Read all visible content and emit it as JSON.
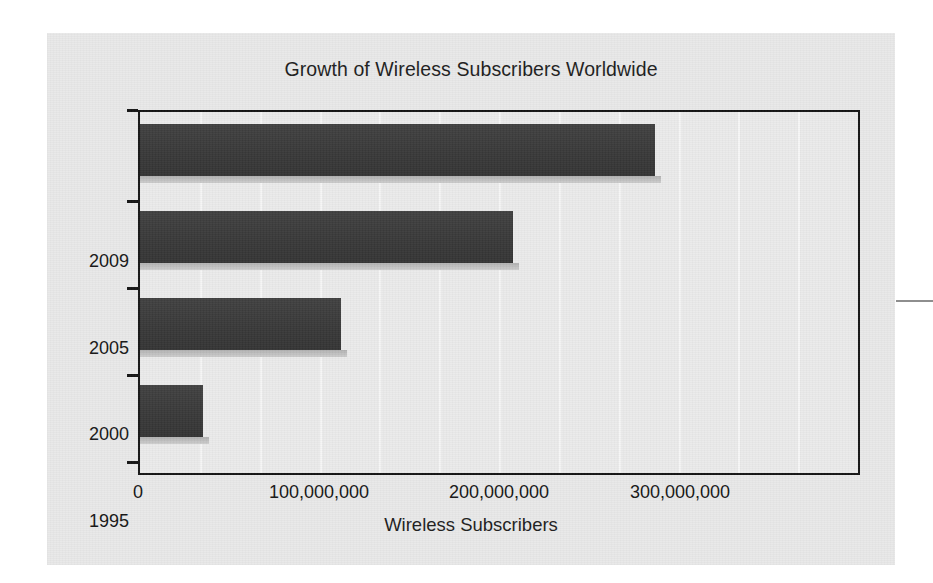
{
  "chart_data": {
    "type": "bar",
    "orientation": "horizontal",
    "title": "Growth of Wireless Subscribers Worldwide",
    "xlabel": "Wireless Subscribers",
    "ylabel": "",
    "categories": [
      "2009",
      "2005",
      "2000",
      "1995"
    ],
    "values": [
      287000000,
      208000000,
      112000000,
      35000000
    ],
    "series": [
      {
        "name": "Wireless Subscribers",
        "values": [
          287000000,
          208000000,
          112000000,
          35000000
        ]
      }
    ],
    "xlim": [
      0,
      400000000
    ],
    "ylim_categories": [
      "1995",
      "2000",
      "2005",
      "2009"
    ],
    "xticks": [
      0,
      100000000,
      200000000,
      300000000
    ],
    "xtick_labels": [
      "0",
      "100,000,000",
      "200,000,000",
      "300,000,000"
    ],
    "ytick_labels": [
      "2009",
      "2005",
      "2000",
      "1995"
    ],
    "grid": true,
    "grid_axis": "x",
    "gridline_values": [
      35000000,
      70000000,
      105000000,
      140000000,
      175000000,
      210000000,
      245000000
    ],
    "legend": false,
    "legend_position": "none",
    "bar_color": "#3c3c3c",
    "bar_shadow_color": "#bdbdbd",
    "plot_background": "#ebebeb",
    "panel_background": "#e9e9e9",
    "axis_color": "#141414",
    "gridline_color": "#f6f6f6",
    "text_color": "#151515"
  },
  "figure": {
    "title": "Growth of Wireless Subscribers Worldwide",
    "x_axis_label": "Wireless Subscribers",
    "x_ticks": [
      {
        "label": "0",
        "value": 0
      },
      {
        "label": "100,000,000",
        "value": 100000000
      },
      {
        "label": "200,000,000",
        "value": 200000000
      },
      {
        "label": "300,000,000",
        "value": 300000000
      }
    ],
    "bars": [
      {
        "label": "2009",
        "value": 287000000
      },
      {
        "label": "2005",
        "value": 208000000
      },
      {
        "label": "2000",
        "value": 112000000
      },
      {
        "label": "1995",
        "value": 35000000
      }
    ]
  }
}
